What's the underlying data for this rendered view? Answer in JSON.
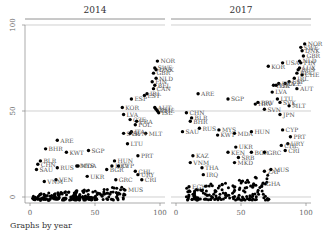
{
  "chart_data": {
    "type": "scatter",
    "layout": "by-panel",
    "caption": "Graphs by year",
    "xlabel": "",
    "ylabel": "",
    "xlim": [
      0,
      100
    ],
    "ylim": [
      0,
      100
    ],
    "x_ticks": [
      0,
      50,
      100
    ],
    "y_ticks": [
      0,
      50,
      100
    ],
    "grid": "horizontal at 0, 50, 100",
    "marker": "filled circle, black",
    "panels": [
      {
        "title": "2014",
        "points": [
          {
            "label": "NOR",
            "x": 98,
            "y": 79
          },
          {
            "label": "SWE",
            "x": 96,
            "y": 75
          },
          {
            "label": "DNK",
            "x": 97,
            "y": 74
          },
          {
            "label": "GBR",
            "x": 95,
            "y": 72
          },
          {
            "label": "NLD",
            "x": 97,
            "y": 69
          },
          {
            "label": "FIN",
            "x": 94,
            "y": 67
          },
          {
            "label": "BEL",
            "x": 96,
            "y": 65
          },
          {
            "label": "CAN",
            "x": 95,
            "y": 63
          },
          {
            "label": "IRL",
            "x": 90,
            "y": 60
          },
          {
            "label": "EST",
            "x": 88,
            "y": 59
          },
          {
            "label": "ESP",
            "x": 78,
            "y": 57
          },
          {
            "label": "KOR",
            "x": 71,
            "y": 52
          },
          {
            "label": "AUT",
            "x": 96,
            "y": 52
          },
          {
            "label": "DEU",
            "x": 97,
            "y": 51
          },
          {
            "label": "CHE",
            "x": 98,
            "y": 50
          },
          {
            "label": "ISL",
            "x": 99,
            "y": 49
          },
          {
            "label": "LVA",
            "x": 72,
            "y": 48
          },
          {
            "label": "CZE",
            "x": 77,
            "y": 45
          },
          {
            "label": "FRA",
            "x": 82,
            "y": 44
          },
          {
            "label": "POL",
            "x": 81,
            "y": 42
          },
          {
            "label": "ITA",
            "x": 78,
            "y": 38
          },
          {
            "label": "MLT",
            "x": 89,
            "y": 37
          },
          {
            "label": "SVK",
            "x": 72,
            "y": 37
          },
          {
            "label": "SVN",
            "x": 77,
            "y": 37
          },
          {
            "label": "LTU",
            "x": 75,
            "y": 31
          },
          {
            "label": "PRT",
            "x": 83,
            "y": 24
          },
          {
            "label": "ARE",
            "x": 21,
            "y": 33
          },
          {
            "label": "BHR",
            "x": 12,
            "y": 28
          },
          {
            "label": "KWT",
            "x": 28,
            "y": 26
          },
          {
            "label": "SGP",
            "x": 45,
            "y": 27
          },
          {
            "label": "HUN",
            "x": 65,
            "y": 21
          },
          {
            "label": "HRV",
            "x": 63,
            "y": 18
          },
          {
            "label": "CYP",
            "x": 68,
            "y": 18
          },
          {
            "label": "BGR",
            "x": 59,
            "y": 16
          },
          {
            "label": "BLR",
            "x": 8,
            "y": 21
          },
          {
            "label": "CHN",
            "x": 6,
            "y": 19
          },
          {
            "label": "SAU",
            "x": 5,
            "y": 16
          },
          {
            "label": "RUS",
            "x": 21,
            "y": 17
          },
          {
            "label": "MYS",
            "x": 36,
            "y": 18
          },
          {
            "label": "MDA",
            "x": 37,
            "y": 18
          },
          {
            "label": "VEN",
            "x": 20,
            "y": 10
          },
          {
            "label": "VNM",
            "x": 11,
            "y": 9
          },
          {
            "label": "UKR",
            "x": 44,
            "y": 12
          },
          {
            "label": "CHL",
            "x": 81,
            "y": 15
          },
          {
            "label": "URY",
            "x": 83,
            "y": 13
          },
          {
            "label": "CRI",
            "x": 86,
            "y": 10
          },
          {
            "label": "GRC",
            "x": 66,
            "y": 10
          },
          {
            "label": "MUS",
            "x": 73,
            "y": 4
          }
        ],
        "unlabeled_cluster": {
          "x_range": [
            2,
            75
          ],
          "y_range": [
            0,
            8
          ],
          "approx_count": 200
        }
      },
      {
        "title": "2017",
        "points": [
          {
            "label": "NOR",
            "x": 99,
            "y": 89
          },
          {
            "label": "SWE",
            "x": 96,
            "y": 87
          },
          {
            "label": "DNK",
            "x": 97,
            "y": 85
          },
          {
            "label": "GBR",
            "x": 98,
            "y": 82
          },
          {
            "label": "NLD",
            "x": 95,
            "y": 79
          },
          {
            "label": "FIN",
            "x": 96,
            "y": 78
          },
          {
            "label": "USA",
            "x": 82,
            "y": 78
          },
          {
            "label": "KOR",
            "x": 71,
            "y": 76
          },
          {
            "label": "RUS2",
            "x": 94,
            "y": 74
          },
          {
            "label": "LUX",
            "x": 95,
            "y": 75
          },
          {
            "label": "BEL",
            "x": 93,
            "y": 72
          },
          {
            "label": "CHE",
            "x": 97,
            "y": 71
          },
          {
            "label": "IRL",
            "x": 91,
            "y": 69
          },
          {
            "label": "ESP",
            "x": 87,
            "y": 67
          },
          {
            "label": "CZE",
            "x": 84,
            "y": 66
          },
          {
            "label": "FRA",
            "x": 79,
            "y": 66
          },
          {
            "label": "POL",
            "x": 75,
            "y": 65
          },
          {
            "label": "ITA",
            "x": 77,
            "y": 65
          },
          {
            "label": "AUT",
            "x": 93,
            "y": 63
          },
          {
            "label": "LVA",
            "x": 74,
            "y": 61
          },
          {
            "label": "ARE",
            "x": 17,
            "y": 60
          },
          {
            "label": "SGP",
            "x": 40,
            "y": 57
          },
          {
            "label": "LTU",
            "x": 78,
            "y": 57
          },
          {
            "label": "SVK",
            "x": 80,
            "y": 55
          },
          {
            "label": "HRV",
            "x": 61,
            "y": 54
          },
          {
            "label": "BRV",
            "x": 63,
            "y": 55
          },
          {
            "label": "MLT",
            "x": 87,
            "y": 53
          },
          {
            "label": "SVN",
            "x": 68,
            "y": 51
          },
          {
            "label": "JPN",
            "x": 80,
            "y": 48
          },
          {
            "label": "CHN",
            "x": 8,
            "y": 49
          },
          {
            "label": "BLR",
            "x": 12,
            "y": 46
          },
          {
            "label": "BHR",
            "x": 11,
            "y": 44
          },
          {
            "label": "SAU",
            "x": 5,
            "y": 38
          },
          {
            "label": "RUS",
            "x": 18,
            "y": 40
          },
          {
            "label": "MYS",
            "x": 33,
            "y": 39
          },
          {
            "label": "KWT",
            "x": 32,
            "y": 36
          },
          {
            "label": "MDA",
            "x": 45,
            "y": 37
          },
          {
            "label": "HUN",
            "x": 58,
            "y": 38
          },
          {
            "label": "CYP",
            "x": 82,
            "y": 39
          },
          {
            "label": "PRT",
            "x": 88,
            "y": 35
          },
          {
            "label": "URY",
            "x": 86,
            "y": 31
          },
          {
            "label": "CHL",
            "x": 81,
            "y": 30
          },
          {
            "label": "CRI",
            "x": 84,
            "y": 27
          },
          {
            "label": "UKR",
            "x": 46,
            "y": 29
          },
          {
            "label": "KEN",
            "x": 40,
            "y": 26
          },
          {
            "label": "BGR",
            "x": 58,
            "y": 26
          },
          {
            "label": "GRC",
            "x": 68,
            "y": 26
          },
          {
            "label": "SRB",
            "x": 48,
            "y": 23
          },
          {
            "label": "KAZ",
            "x": 13,
            "y": 24
          },
          {
            "label": "VNM",
            "x": 11,
            "y": 20
          },
          {
            "label": "MKD",
            "x": 45,
            "y": 20
          },
          {
            "label": "THA",
            "x": 20,
            "y": 17
          },
          {
            "label": "IRQ",
            "x": 21,
            "y": 13
          },
          {
            "label": "ZAF",
            "x": 68,
            "y": 15
          },
          {
            "label": "MUS",
            "x": 73,
            "y": 16
          },
          {
            "label": "GHA",
            "x": 67,
            "y": 8
          },
          {
            "label": "EGY",
            "x": 10,
            "y": 6
          }
        ],
        "unlabeled_cluster": {
          "x_range": [
            8,
            72
          ],
          "y_range": [
            0,
            15
          ],
          "approx_count": 160
        }
      }
    ]
  },
  "ui": {
    "caption": "Graphs by year",
    "panel_titles": [
      "2014",
      "2017"
    ],
    "y_tick_labels": [
      "0",
      "50",
      "100"
    ],
    "x_tick_labels": [
      "0",
      "50",
      "100"
    ]
  },
  "colors": {
    "marker": "#000000",
    "label": "#555555",
    "grid": "#bbbbbb",
    "axis": "#888888",
    "title_line": "#777777"
  }
}
